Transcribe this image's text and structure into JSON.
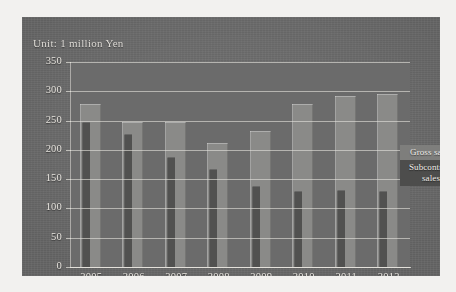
{
  "figure": {
    "unit_label": "Unit: 1 million Yen"
  },
  "legend": {
    "gross_label": "Gross sales",
    "subcontract_label": "Subcontract sales"
  },
  "colors": {
    "figure_background": "#6f6f6f",
    "plot_background": "#6b6b6b",
    "gross_bar": "#8a8a88",
    "subcontract_bar": "#515150",
    "gridline": "#e4e2dc",
    "text": "#e6e3dd"
  },
  "chart_data": {
    "type": "bar",
    "title": "",
    "subtitle": "",
    "xlabel": "",
    "ylabel": "Unit: 1 million Yen",
    "categories": [
      "2005",
      "2006",
      "2007",
      "2008",
      "2009",
      "2010",
      "2011",
      "2012"
    ],
    "series": [
      {
        "name": "Gross sales",
        "values": [
          278,
          248,
          248,
          212,
          232,
          278,
          292,
          295
        ]
      },
      {
        "name": "Subcontract sales",
        "values": [
          248,
          227,
          188,
          167,
          138,
          130,
          132,
          130
        ]
      }
    ],
    "yticks": [
      0,
      50,
      100,
      150,
      200,
      250,
      300,
      350
    ],
    "ylim": [
      0,
      350
    ],
    "grid": true,
    "grid_axis": "y",
    "legend_position": "right-inside"
  }
}
